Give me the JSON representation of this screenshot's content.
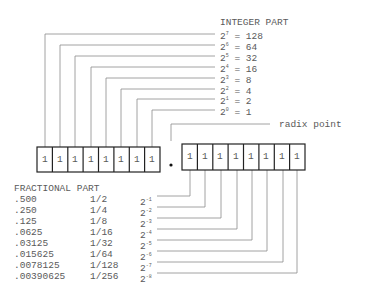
{
  "integer_part": {
    "title": "INTEGER PART",
    "rows": [
      {
        "exp": "7",
        "value": "128"
      },
      {
        "exp": "6",
        "value": "64"
      },
      {
        "exp": "5",
        "value": "32"
      },
      {
        "exp": "4",
        "value": "16"
      },
      {
        "exp": "3",
        "value": "8"
      },
      {
        "exp": "2",
        "value": "4"
      },
      {
        "exp": "1",
        "value": "2"
      },
      {
        "exp": "0",
        "value": "1"
      }
    ]
  },
  "radix": {
    "label": "radix point",
    "symbol": "•"
  },
  "registers": {
    "integer_bits": [
      "1",
      "1",
      "1",
      "1",
      "1",
      "1",
      "1",
      "1"
    ],
    "fraction_bits": [
      "1",
      "1",
      "1",
      "1",
      "1",
      "1",
      "1",
      "1"
    ]
  },
  "fractional_part": {
    "title": "FRACTIONAL PART",
    "rows": [
      {
        "decimal": ".500",
        "fraction": "1/2",
        "exp": "-1"
      },
      {
        "decimal": ".250",
        "fraction": "1/4",
        "exp": "-2"
      },
      {
        "decimal": ".125",
        "fraction": "1/8",
        "exp": "-3"
      },
      {
        "decimal": ".0625",
        "fraction": "1/16",
        "exp": "-4"
      },
      {
        "decimal": ".03125",
        "fraction": "1/32",
        "exp": "-5"
      },
      {
        "decimal": ".015625",
        "fraction": "1/64",
        "exp": "-6"
      },
      {
        "decimal": ".0078125",
        "fraction": "1/128",
        "exp": "-7"
      },
      {
        "decimal": ".00390625",
        "fraction": "1/256",
        "exp": "-8"
      }
    ]
  },
  "colors": {
    "line": "#8a8a8a",
    "box": "#222222",
    "text": "#5a5a5a"
  }
}
